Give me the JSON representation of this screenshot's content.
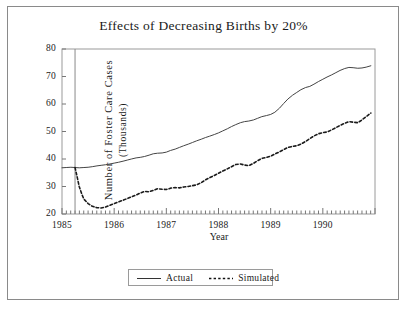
{
  "chart_data": {
    "type": "line",
    "title": "Effects of Decreasing Births by 20%",
    "xlabel": "Year",
    "ylabel": "Number of Foster Care Cases",
    "ylabel_sub": "(Thousands)",
    "xlim": [
      1985.0,
      1991.0
    ],
    "ylim": [
      20,
      80
    ],
    "yticks": [
      20,
      30,
      40,
      50,
      60,
      70,
      80
    ],
    "xticks": [
      1985,
      1986,
      1987,
      1988,
      1989,
      1990
    ],
    "xtick_labels": [
      "1985",
      "1986",
      "1987",
      "1988",
      "1989",
      "1990"
    ],
    "minor_xtick_interval_months": 1,
    "grid": false,
    "legend_position": "below-axes-center",
    "intervention_line_x": 1985.25,
    "series": [
      {
        "name": "Actual",
        "style": "solid",
        "color": "#444444",
        "x": [
          1985.0,
          1985.08,
          1985.17,
          1985.25,
          1985.33,
          1985.42,
          1985.5,
          1985.58,
          1985.67,
          1985.75,
          1985.83,
          1985.92,
          1986.0,
          1986.08,
          1986.17,
          1986.25,
          1986.33,
          1986.42,
          1986.5,
          1986.58,
          1986.67,
          1986.75,
          1986.83,
          1986.92,
          1987.0,
          1987.08,
          1987.17,
          1987.25,
          1987.33,
          1987.42,
          1987.5,
          1987.58,
          1987.67,
          1987.75,
          1987.83,
          1987.92,
          1988.0,
          1988.08,
          1988.17,
          1988.25,
          1988.33,
          1988.42,
          1988.5,
          1988.58,
          1988.67,
          1988.75,
          1988.83,
          1988.92,
          1989.0,
          1989.08,
          1989.17,
          1989.25,
          1989.33,
          1989.42,
          1989.5,
          1989.58,
          1989.67,
          1989.75,
          1989.83,
          1989.92,
          1990.0,
          1990.08,
          1990.17,
          1990.25,
          1990.33,
          1990.42,
          1990.5,
          1990.58,
          1990.67,
          1990.75,
          1990.83,
          1990.92
        ],
        "values": [
          36.8,
          36.9,
          37.0,
          36.9,
          36.8,
          36.9,
          37.0,
          37.2,
          37.5,
          37.7,
          37.9,
          38.2,
          38.5,
          38.8,
          39.2,
          39.6,
          40.0,
          40.4,
          40.6,
          40.9,
          41.4,
          41.9,
          42.1,
          42.2,
          42.5,
          43.1,
          43.6,
          44.2,
          44.8,
          45.4,
          46.0,
          46.6,
          47.2,
          47.8,
          48.3,
          48.9,
          49.5,
          50.2,
          51.0,
          51.8,
          52.5,
          53.2,
          53.6,
          53.8,
          54.2,
          54.8,
          55.4,
          55.8,
          56.2,
          57.0,
          58.5,
          60.2,
          61.8,
          63.2,
          64.2,
          65.2,
          66.0,
          66.4,
          67.2,
          68.2,
          69.0,
          69.8,
          70.6,
          71.4,
          72.2,
          72.9,
          73.3,
          73.2,
          73.0,
          73.1,
          73.4,
          73.9
        ]
      },
      {
        "name": "Simulated",
        "style": "dotted",
        "color": "#1a1a1a",
        "x": [
          1985.25,
          1985.29,
          1985.33,
          1985.38,
          1985.42,
          1985.5,
          1985.58,
          1985.67,
          1985.75,
          1985.83,
          1985.92,
          1986.0,
          1986.08,
          1986.17,
          1986.25,
          1986.33,
          1986.42,
          1986.5,
          1986.58,
          1986.67,
          1986.75,
          1986.83,
          1986.92,
          1987.0,
          1987.08,
          1987.17,
          1987.25,
          1987.33,
          1987.42,
          1987.5,
          1987.58,
          1987.67,
          1987.75,
          1987.83,
          1987.92,
          1988.0,
          1988.08,
          1988.17,
          1988.25,
          1988.33,
          1988.42,
          1988.5,
          1988.58,
          1988.67,
          1988.75,
          1988.83,
          1988.92,
          1989.0,
          1989.08,
          1989.17,
          1989.25,
          1989.33,
          1989.42,
          1989.5,
          1989.58,
          1989.67,
          1989.75,
          1989.83,
          1989.92,
          1990.0,
          1990.08,
          1990.17,
          1990.25,
          1990.33,
          1990.42,
          1990.5,
          1990.58,
          1990.67,
          1990.75,
          1990.83,
          1990.92
        ],
        "values": [
          36.9,
          33.5,
          30.0,
          27.2,
          25.4,
          23.8,
          22.8,
          22.3,
          22.2,
          22.5,
          23.2,
          23.8,
          24.4,
          25.0,
          25.6,
          26.2,
          26.9,
          27.6,
          28.2,
          28.1,
          28.6,
          29.2,
          29.0,
          28.9,
          29.4,
          29.6,
          29.5,
          29.8,
          30.0,
          30.3,
          30.6,
          31.4,
          32.4,
          33.2,
          34.0,
          34.8,
          35.6,
          36.4,
          37.2,
          38.0,
          38.2,
          37.8,
          37.6,
          38.4,
          39.4,
          40.2,
          40.6,
          41.0,
          41.8,
          42.6,
          43.4,
          44.2,
          44.6,
          44.8,
          45.4,
          46.4,
          47.4,
          48.4,
          49.2,
          49.6,
          49.8,
          50.6,
          51.4,
          52.2,
          53.0,
          53.6,
          53.4,
          53.2,
          54.2,
          55.4,
          56.7
        ]
      }
    ]
  },
  "legend": {
    "items": [
      {
        "label": "Actual",
        "style": "solid"
      },
      {
        "label": "Simulated",
        "style": "dotted"
      }
    ]
  }
}
